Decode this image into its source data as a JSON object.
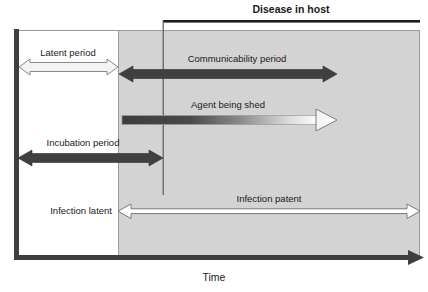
{
  "figure": {
    "title": "Disease in host",
    "axis_label": "Time",
    "colors": {
      "background": "#ffffff",
      "shaded_region": "#d2d2d2",
      "dark_arrow": "#404040",
      "axis": "#3a3a3a",
      "outline": "#8c8c8c",
      "text": "#1a1a1a",
      "white_arrow_fill": "#ffffff"
    }
  },
  "bands": {
    "unshaded_label": "",
    "shaded_label": ""
  },
  "bars": [
    {
      "id": "latent-period",
      "label": "Latent period",
      "style": "white-outline",
      "heads": "double",
      "x_start": 18,
      "x_end": 118,
      "y": 67
    },
    {
      "id": "communicability-period",
      "label": "Communicability period",
      "style": "dark-solid",
      "heads": "double",
      "x_start": 120,
      "x_end": 337,
      "y": 74
    },
    {
      "id": "agent-being-shed",
      "label": "Agent being shed",
      "style": "gradient-dark-to-white",
      "heads": "right",
      "x_start": 122,
      "x_end": 337,
      "y": 120
    },
    {
      "id": "incubation-period",
      "label": "Incubation period",
      "style": "dark-solid",
      "heads": "double",
      "x_start": 18,
      "x_end": 163,
      "y": 158
    },
    {
      "id": "infection-latent",
      "label": "Infection latent",
      "style": "label-only",
      "heads": "none",
      "x_start": 18,
      "x_end": 118,
      "y": 211
    },
    {
      "id": "infection-patent",
      "label": "Infection patent",
      "style": "white-outline-thin",
      "heads": "double",
      "x_start": 118,
      "x_end": 420,
      "y": 211
    }
  ]
}
